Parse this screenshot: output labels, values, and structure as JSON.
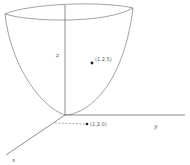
{
  "diagram": {
    "type": "3d-surface-sketch",
    "surface": "paraboloid",
    "axes": {
      "x_label": "x",
      "y_label": "y",
      "z_label": "z"
    },
    "points": [
      {
        "label": "(1,2,5)",
        "description": "point on paraboloid surface"
      },
      {
        "label": "(1,2,0)",
        "description": "projection onto xy-plane"
      }
    ]
  }
}
